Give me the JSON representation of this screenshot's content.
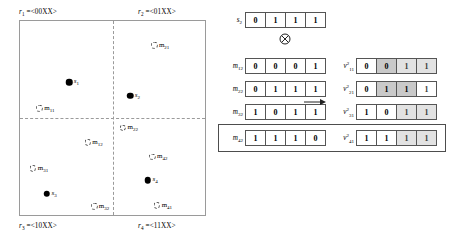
{
  "figure": {
    "left_panel": {
      "name": "quadrant-region-map",
      "quadrant_labels": [
        {
          "id": "r1",
          "var": "r",
          "sub": "1",
          "eq": " =<00XX>",
          "pos": "top-left"
        },
        {
          "id": "r2",
          "var": "r",
          "sub": "2",
          "eq": " =<01XX>",
          "pos": "top-right"
        },
        {
          "id": "r3",
          "var": "r",
          "sub": "3",
          "eq": " =<10XX>",
          "pos": "bottom-left"
        },
        {
          "id": "r4",
          "var": "r",
          "sub": "4",
          "eq": " =<11XX>",
          "pos": "bottom-right"
        }
      ],
      "points": [
        {
          "name": "s1",
          "var": "s",
          "sub": "1",
          "type": "solid",
          "x": 26.5,
          "y": 31.5
        },
        {
          "name": "m11",
          "var": "m",
          "sub": "11",
          "type": "open",
          "x": 10.5,
          "y": 45.0
        },
        {
          "name": "m12",
          "var": "m",
          "sub": "12",
          "type": "open",
          "x": 36.5,
          "y": 62.5
        },
        {
          "name": "m21",
          "var": "m",
          "sub": "21",
          "type": "open",
          "x": 72.5,
          "y": 12.5
        },
        {
          "name": "s2",
          "var": "s",
          "sub": "2",
          "type": "solid",
          "x": 59.5,
          "y": 38.5
        },
        {
          "name": "m22",
          "var": "m",
          "sub": "22",
          "type": "open",
          "x": 55.5,
          "y": 55.0
        },
        {
          "name": "m31",
          "var": "m",
          "sub": "31",
          "type": "open",
          "x": 7.0,
          "y": 76.0
        },
        {
          "name": "s3",
          "var": "s",
          "sub": "3",
          "type": "solid",
          "x": 14.5,
          "y": 89.0
        },
        {
          "name": "m32",
          "var": "m",
          "sub": "32",
          "type": "open",
          "x": 40.0,
          "y": 95.5
        },
        {
          "name": "m42",
          "var": "m",
          "sub": "42",
          "type": "open",
          "x": 71.5,
          "y": 70.0
        },
        {
          "name": "s4",
          "var": "s",
          "sub": "4",
          "type": "solid",
          "x": 69.0,
          "y": 82.0
        },
        {
          "name": "m41",
          "var": "m",
          "sub": "41",
          "type": "open",
          "x": 74.0,
          "y": 95.0
        }
      ]
    },
    "right_panel": {
      "name": "bitvector-xor-table",
      "operator": "xor-circled",
      "arrow": "right-arrow",
      "top_row": {
        "label_var": "s",
        "label_sub": "2",
        "bits": [
          "0",
          "1",
          "1",
          "1"
        ]
      },
      "input_rows": [
        {
          "label_var": "m",
          "label_sub": "12",
          "bits": [
            "0",
            "0",
            "0",
            "1"
          ]
        },
        {
          "label_var": "m",
          "label_sub": "22",
          "bits": [
            "0",
            "1",
            "1",
            "1"
          ]
        },
        {
          "label_var": "m",
          "label_sub": "32",
          "bits": [
            "1",
            "0",
            "1",
            "1"
          ]
        },
        {
          "label_var": "m",
          "label_sub": "42",
          "bits": [
            "1",
            "1",
            "1",
            "0"
          ]
        }
      ],
      "output_rows": [
        {
          "label_var": "v",
          "label_sup": "2",
          "label_sub": "11",
          "bits": [
            "0",
            "0",
            "1",
            "1"
          ],
          "shades": [
            "none",
            "dark",
            "light",
            "light"
          ]
        },
        {
          "label_var": "v",
          "label_sup": "2",
          "label_sub": "21",
          "bits": [
            "0",
            "1",
            "1",
            "1"
          ],
          "shades": [
            "none",
            "dark",
            "dark",
            "none"
          ]
        },
        {
          "label_var": "v",
          "label_sup": "2",
          "label_sub": "31",
          "bits": [
            "1",
            "0",
            "1",
            "1"
          ],
          "shades": [
            "none",
            "none",
            "light",
            "light"
          ]
        },
        {
          "label_var": "v",
          "label_sup": "2",
          "label_sub": "41",
          "bits": [
            "1",
            "1",
            "1",
            "1"
          ],
          "shades": [
            "none",
            "none",
            "light",
            "light"
          ]
        }
      ],
      "highlighted_row_index": 3
    }
  },
  "colors": {
    "ink": "#000000",
    "cell_border": "#555555",
    "box_border": "#9a9a9a",
    "shade_light": "#e2e2e2",
    "shade_dark": "#c9c9c9",
    "highlight_border": "#4d4d4d"
  }
}
